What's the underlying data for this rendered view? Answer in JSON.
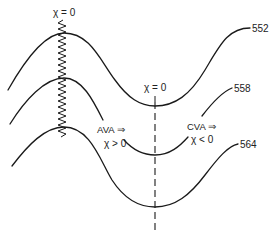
{
  "diagram": {
    "labels": {
      "chi_zero_left": "χ = 0",
      "chi_zero_center": "χ = 0",
      "ava": "AVA ⇒",
      "ava_condition": "χ > 0",
      "cva": "CVA ⇒",
      "cva_condition": "χ < 0"
    },
    "curves": [
      {
        "label": "552"
      },
      {
        "label": "558"
      },
      {
        "label": "564"
      }
    ],
    "colors": {
      "line": "#1a1a1a",
      "background": "#ffffff"
    }
  }
}
